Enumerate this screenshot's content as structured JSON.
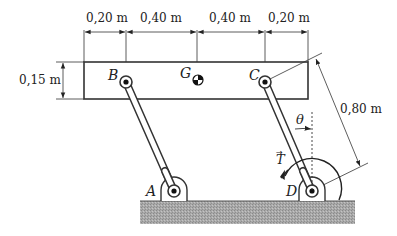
{
  "diagram": {
    "type": "mechanism",
    "dimensions": {
      "top": [
        "0,20 m",
        "0,40 m",
        "0,40 m",
        "0,20 m"
      ],
      "beam_height": "0,15 m",
      "link_length": "0,80 m"
    },
    "points": {
      "A": "A",
      "B": "B",
      "C": "C",
      "D": "D",
      "G": "G"
    },
    "angle_label": "θ",
    "torque_label": "T",
    "torque_vector_mark": "→"
  }
}
